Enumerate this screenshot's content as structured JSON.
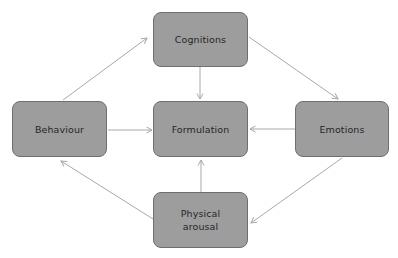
{
  "diagram": {
    "type": "cycle-flow",
    "colors": {
      "node_fill": "#9d9d9d",
      "node_border": "#6f6f6f",
      "text": "#262626",
      "arrow": "#a8a8a8",
      "background": "#ffffff"
    },
    "nodes": {
      "cognitions": {
        "label": "Cognitions"
      },
      "behaviour": {
        "label": "Behaviour"
      },
      "formulation": {
        "label": "Formulation"
      },
      "emotions": {
        "label": "Emotions"
      },
      "physical_arousal": {
        "line1": "Physical",
        "line2": "arousal"
      }
    },
    "edges": [
      {
        "from": "Behaviour",
        "to": "Cognitions"
      },
      {
        "from": "Cognitions",
        "to": "Emotions"
      },
      {
        "from": "Emotions",
        "to": "Physical arousal"
      },
      {
        "from": "Physical arousal",
        "to": "Behaviour"
      },
      {
        "from": "Cognitions",
        "to": "Formulation"
      },
      {
        "from": "Behaviour",
        "to": "Formulation"
      },
      {
        "from": "Emotions",
        "to": "Formulation"
      },
      {
        "from": "Physical arousal",
        "to": "Formulation"
      }
    ]
  }
}
